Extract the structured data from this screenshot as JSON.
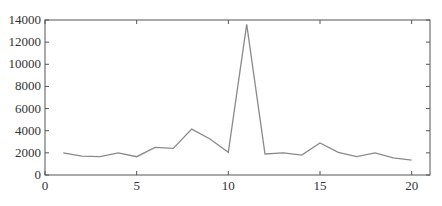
{
  "chart_data": {
    "type": "line",
    "title": "",
    "xlabel": "",
    "ylabel": "",
    "x": [
      1,
      2,
      3,
      4,
      5,
      6,
      7,
      8,
      9,
      10,
      11,
      12,
      13,
      14,
      15,
      16,
      17,
      18,
      19,
      20
    ],
    "series": [
      {
        "name": "series-1",
        "values": [
          2000,
          1700,
          1650,
          2000,
          1650,
          2500,
          2400,
          4150,
          3250,
          2050,
          13600,
          1900,
          2000,
          1800,
          2900,
          2050,
          1650,
          2000,
          1550,
          1350
        ],
        "color": "#8a8a8a"
      }
    ],
    "xlim": [
      0,
      21
    ],
    "ylim": [
      0,
      14000
    ],
    "xticks": [
      0,
      5,
      10,
      15,
      20
    ],
    "yticks": [
      0,
      2000,
      4000,
      6000,
      8000,
      10000,
      12000,
      14000
    ],
    "xtick_labels": [
      "0",
      "5",
      "10",
      "15",
      "20"
    ],
    "ytick_labels": [
      "0",
      "2000",
      "4000",
      "6000",
      "8000",
      "10000",
      "12000",
      "14000"
    ],
    "grid": false,
    "legend": null,
    "axis_color": "#555555"
  }
}
